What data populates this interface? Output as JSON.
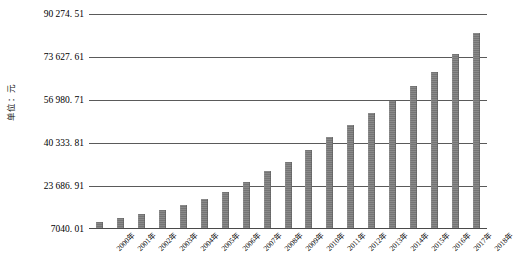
{
  "chart_data": {
    "type": "bar",
    "title": "",
    "subtitle": "",
    "xlabel": "",
    "ylabel": "单位：元",
    "grid": true,
    "legend": null,
    "categories": [
      "2000年",
      "2001年",
      "2002年",
      "2003年",
      "2004年",
      "2005年",
      "2006年",
      "2007年",
      "2008年",
      "2009年",
      "2010年",
      "2011年",
      "2012年",
      "2013年",
      "2014年",
      "2015年",
      "2016年",
      "2017年",
      "2018年"
    ],
    "values": [
      9371,
      10870,
      12422,
      14040,
      16024,
      18364,
      21001,
      24932,
      29229,
      32736,
      37147,
      42452,
      46769,
      51483,
      56360,
      62029,
      67569,
      74318,
      82413
    ],
    "ylim": [
      7040.01,
      90274.51
    ],
    "ytick_labels": [
      "90 274. 51",
      "73 627. 61",
      "56 980. 71",
      "40 333. 81",
      "23 686. 91",
      "7040. 01"
    ],
    "ytick_values": [
      90274.51,
      73627.61,
      56980.71,
      40333.81,
      23686.91,
      7040.01
    ],
    "bar_color": "#7d7d7d",
    "gridline_color": "#5a5a5a",
    "background_color": "#ffffff"
  }
}
